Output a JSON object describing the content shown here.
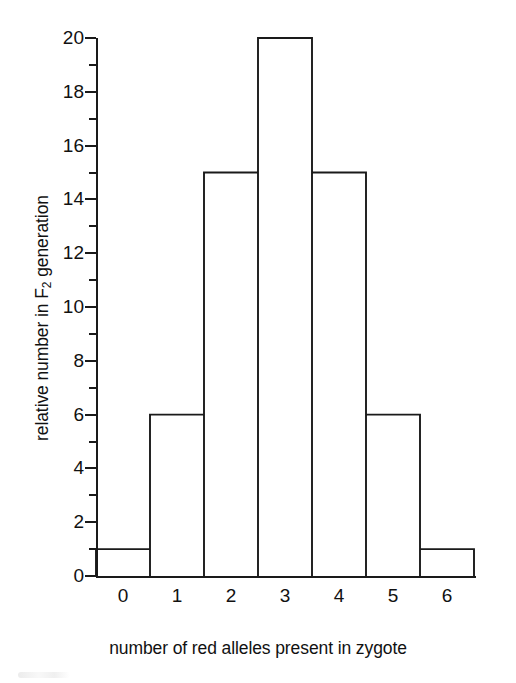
{
  "chart_data": {
    "type": "bar",
    "title": "",
    "subtitle": "",
    "xlabel": "number of red alleles present in zygote",
    "ylabel": "relative number in F2 generation",
    "ylabel_prefix": "relative number in F",
    "ylabel_subscript": "2",
    "ylabel_suffix": " generation",
    "categories": [
      "0",
      "1",
      "2",
      "3",
      "4",
      "5",
      "6"
    ],
    "values": [
      1,
      6,
      15,
      20,
      15,
      6,
      1
    ],
    "xlim": [
      -0.5,
      6.5
    ],
    "ylim": [
      0,
      20
    ],
    "y_major_ticks": [
      0,
      2,
      4,
      6,
      8,
      10,
      12,
      14,
      16,
      18,
      20
    ],
    "y_minor_ticks": [
      1,
      3,
      5,
      7,
      9,
      11,
      13,
      15,
      17,
      19
    ],
    "y_tick_labels": [
      "0",
      "2",
      "4",
      "6",
      "8",
      "10",
      "12",
      "14",
      "16",
      "18",
      "20"
    ],
    "x_tick_labels": [
      "0",
      "1",
      "2",
      "3",
      "4",
      "5",
      "6"
    ],
    "grid": false,
    "legend": false,
    "legend_position": "none",
    "bar_style": "outlined-contiguous-histogram",
    "colors": {
      "background": "#ffffff",
      "axis": "#1a1a1a",
      "bar_stroke": "#1a1a1a",
      "bar_fill": "#ffffff",
      "text": "#111111"
    }
  }
}
